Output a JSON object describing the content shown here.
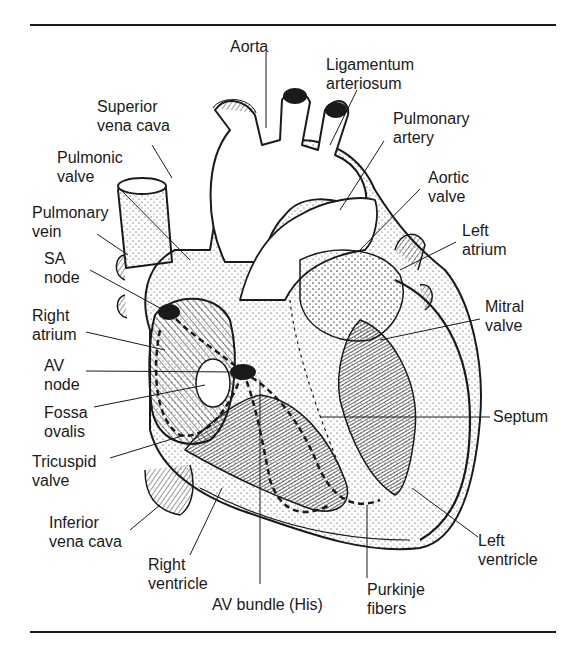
{
  "figure": {
    "labels": {
      "aorta": "Aorta",
      "ligamentum_arteriosum": [
        "Ligamentum",
        "arteriosum"
      ],
      "superior_vena_cava": [
        "Superior",
        "vena cava"
      ],
      "pulmonary_artery": [
        "Pulmonary",
        "artery"
      ],
      "pulmonic_valve": [
        "Pulmonic",
        "valve"
      ],
      "aortic_valve": [
        "Aortic",
        "valve"
      ],
      "pulmonary_vein": [
        "Pulmonary",
        "vein"
      ],
      "left_atrium": [
        "Left",
        "atrium"
      ],
      "sa_node": [
        "SA",
        "node"
      ],
      "mitral_valve": [
        "Mitral",
        "valve"
      ],
      "right_atrium": [
        "Right",
        "atrium"
      ],
      "av_node": [
        "AV",
        "node"
      ],
      "septum": "Septum",
      "fossa_ovalis": [
        "Fossa",
        "ovalis"
      ],
      "tricuspid_valve": [
        "Tricuspid",
        "valve"
      ],
      "inferior_vena_cava": [
        "Inferior",
        "vena cava"
      ],
      "left_ventricle": [
        "Left",
        "ventricle"
      ],
      "right_ventricle": [
        "Right",
        "ventricle"
      ],
      "av_bundle": "AV bundle (His)",
      "purkinje_fibers": [
        "Purkinje",
        "fibers"
      ]
    },
    "colors": {
      "ink": "#1a1a1a",
      "background": "#ffffff"
    }
  }
}
